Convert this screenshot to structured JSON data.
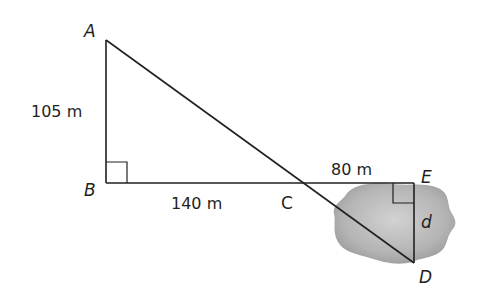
{
  "diagram": {
    "points": {
      "A": {
        "label": "A",
        "x": 106,
        "y": 40
      },
      "B": {
        "label": "B",
        "x": 106,
        "y": 183
      },
      "C": {
        "label": "C",
        "x": 300,
        "y": 183
      },
      "D": {
        "label": "D",
        "x": 414,
        "y": 263
      },
      "E": {
        "label": "E",
        "x": 414,
        "y": 183
      }
    },
    "measurements": {
      "AB": "105 m",
      "BC": "140 m",
      "CE": "80 m",
      "DE": "d"
    },
    "right_angles": [
      "B",
      "E"
    ],
    "region_color": "#a8a8a8",
    "line_color": "#231f20"
  }
}
